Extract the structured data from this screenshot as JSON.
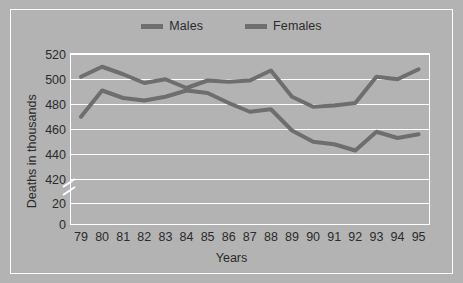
{
  "chart_data": {
    "type": "line",
    "title": "",
    "xlabel": "Years",
    "ylabel": "Deaths in thousands",
    "categories": [
      "79",
      "80",
      "81",
      "82",
      "83",
      "84",
      "85",
      "86",
      "87",
      "88",
      "89",
      "90",
      "91",
      "92",
      "93",
      "94",
      "95"
    ],
    "ytick_labels": [
      "520",
      "500",
      "480",
      "460",
      "440",
      "420",
      "20",
      "0"
    ],
    "ytick_values": [
      520,
      500,
      480,
      460,
      440,
      420,
      20,
      0
    ],
    "ylim": [
      420,
      520
    ],
    "y_axis_break": true,
    "y_axis_break_note": "axis broken between 20 and 420",
    "grid": true,
    "grid_color": "#ffffff",
    "legend_position": "top-center",
    "series": [
      {
        "name": "Males",
        "color": "#6e6e6e",
        "values": [
          501,
          509,
          503,
          496,
          499,
          492,
          498,
          497,
          498,
          506,
          485,
          477,
          478,
          480,
          501,
          499,
          507
        ]
      },
      {
        "name": "Females",
        "color": "#6e6e6e",
        "values": [
          469,
          490,
          484,
          482,
          485,
          490,
          488,
          480,
          473,
          475,
          458,
          449,
          447,
          442,
          457,
          452,
          455
        ]
      }
    ]
  },
  "legend": {
    "entries": [
      {
        "label": "Males",
        "swatch_color": "#6e6e6e",
        "icon": "line-swatch-icon"
      },
      {
        "label": "Females",
        "swatch_color": "#6e6e6e",
        "icon": "line-swatch-icon"
      }
    ]
  },
  "axes": {
    "y_title": "Deaths in thousands",
    "x_title": "Years"
  },
  "colors": {
    "background": "#b3b3b3",
    "plot_background": "#b3b3b3",
    "grid": "#ffffff",
    "frame": "#ffffff",
    "text": "#2b2b2b",
    "series": "#6e6e6e"
  }
}
